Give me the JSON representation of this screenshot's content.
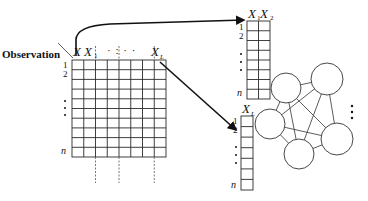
{
  "diagram": {
    "observation_label": "Observation",
    "main_matrix": {
      "column_labels": [
        "X",
        "X",
        "X"
      ],
      "column_subscripts": [
        "",
        "1",
        "L"
      ],
      "col_ellipsis": "· : · ·",
      "row_labels": [
        "1",
        "2",
        "n"
      ],
      "row_ellipsis": "⋮",
      "columns": 8,
      "rows": 10
    },
    "top_table": {
      "column_labels": [
        "X",
        "X"
      ],
      "column_subscripts": [
        "1",
        "2"
      ],
      "row_labels": [
        "1",
        "2",
        "n"
      ],
      "columns": 2,
      "rows": 8
    },
    "bottom_table": {
      "column_labels": [
        "X"
      ],
      "column_subscripts": [
        "L"
      ],
      "row_labels": [
        "1",
        "2",
        "n"
      ],
      "columns": 1,
      "rows": 7
    },
    "graph": {
      "nodes": 5,
      "more_indicator": "⋮"
    },
    "colors": {
      "line": "#2a2a2a",
      "dashed": "#666666",
      "background": "#ffffff"
    }
  }
}
